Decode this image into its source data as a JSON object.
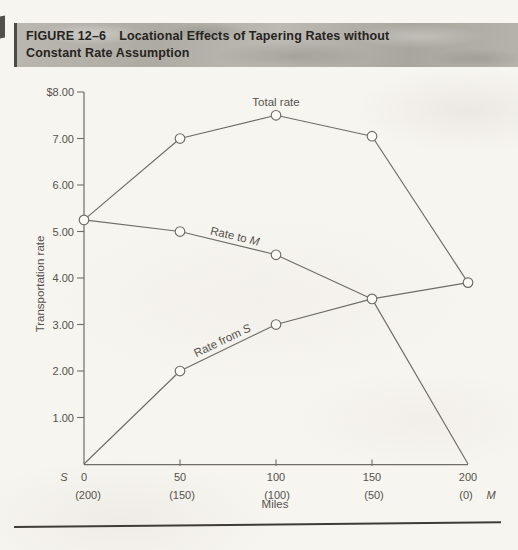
{
  "header": {
    "figure_label": "FIGURE 12–6",
    "title_line1": "Locational Effects of Tapering Rates without",
    "title_line2": "Constant Rate Assumption"
  },
  "colors": {
    "line": "#6f6d68",
    "text": "#55524d",
    "marker_fill": "#faf9f4",
    "band_bg": "#b4b1a9",
    "band_text": "#26241f",
    "rule": "#3e3c37",
    "page_bg": "#f7f5f0"
  },
  "chart_data": {
    "type": "line",
    "title": "",
    "xlabel": "Miles",
    "ylabel": "Transportation rate",
    "xlim": [
      0,
      200
    ],
    "ylim": [
      0,
      8
    ],
    "grid": false,
    "legend": "inline-labels",
    "x": [
      0,
      50,
      100,
      150,
      200
    ],
    "x_tick_labels": [
      "0",
      "50",
      "100",
      "150",
      "200"
    ],
    "x_secondary_labels": [
      "(200)",
      "(150)",
      "(100)",
      "(50)",
      "(0)"
    ],
    "origin_station": "S",
    "terminal_station": "M",
    "y_ticks": [
      {
        "value": 8,
        "label": "$8.00"
      },
      {
        "value": 7,
        "label": "7.00"
      },
      {
        "value": 6,
        "label": "6.00"
      },
      {
        "value": 5,
        "label": "5.00"
      },
      {
        "value": 4,
        "label": "4.00"
      },
      {
        "value": 3,
        "label": "3.00"
      },
      {
        "value": 2,
        "label": "2.00"
      },
      {
        "value": 1,
        "label": "1.00"
      }
    ],
    "series": [
      {
        "name": "Total rate",
        "values": [
          5.25,
          7.0,
          7.5,
          7.05,
          3.9
        ],
        "markers": [
          true,
          true,
          true,
          true,
          true
        ]
      },
      {
        "name": "Rate to M",
        "values": [
          5.25,
          5.0,
          4.5,
          3.55,
          0.0
        ],
        "markers": [
          false,
          true,
          true,
          true,
          false
        ]
      },
      {
        "name": "Rate from S",
        "values": [
          0.0,
          2.0,
          3.0,
          3.55,
          3.9
        ],
        "markers": [
          false,
          true,
          true,
          false,
          false
        ]
      }
    ],
    "marker_style": {
      "shape": "circle",
      "fill": "#faf9f4",
      "stroke": "#6f6d68"
    }
  }
}
